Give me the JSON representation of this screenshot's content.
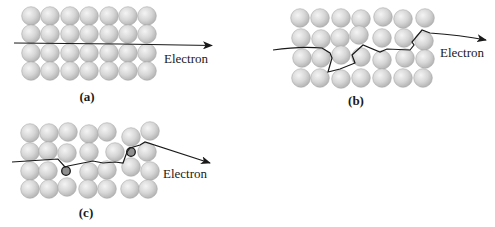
{
  "figure": {
    "panels": [
      {
        "id": "a",
        "label": "(a)",
        "arrow_label": "Electron",
        "description": "Perfect crystal lattice: electron passes straight through"
      },
      {
        "id": "b",
        "label": "(b)",
        "arrow_label": "Electron",
        "description": "Lattice with thermal vibrations: electron path scattered"
      },
      {
        "id": "c",
        "label": "(c)",
        "arrow_label": "Electron",
        "description": "Lattice with impurity atoms: electron scattered by impurities"
      }
    ],
    "colors": {
      "atom_light": "#f2f2f2",
      "atom_dark": "#b5b5b5",
      "impurity": "#8f8f8f",
      "path": "#1a1a1a"
    }
  }
}
